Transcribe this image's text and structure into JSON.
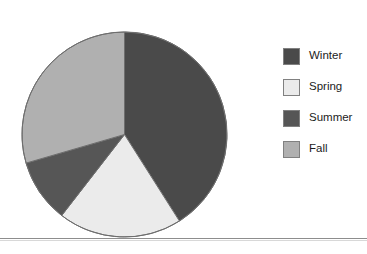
{
  "chart_data": {
    "type": "pie",
    "title": "",
    "categories": [
      "Winter",
      "Spring",
      "Summer",
      "Fall"
    ],
    "values": [
      41,
      19.5,
      10,
      29.5
    ],
    "units": "percent",
    "start_angle_deg": 0,
    "direction": "clockwise",
    "slices": [
      {
        "label": "Winter",
        "value": 41,
        "color": "#4a4a4a",
        "start_deg": 0,
        "end_deg": 147.6
      },
      {
        "label": "Spring",
        "value": 19.5,
        "color": "#ebebeb",
        "start_deg": 147.6,
        "end_deg": 217.8
      },
      {
        "label": "Summer",
        "value": 10,
        "color": "#565656",
        "start_deg": 217.8,
        "end_deg": 253.8
      },
      {
        "label": "Fall",
        "value": 29.5,
        "color": "#b0b0b0",
        "start_deg": 253.8,
        "end_deg": 360
      }
    ],
    "legend": {
      "position": "right",
      "entries": [
        {
          "label": "Winter",
          "color": "#4a4a4a"
        },
        {
          "label": "Spring",
          "color": "#ebebeb"
        },
        {
          "label": "Summer",
          "color": "#565656"
        },
        {
          "label": "Fall",
          "color": "#b0b0b0"
        }
      ]
    },
    "grid": false,
    "xlabel": "",
    "ylabel": ""
  },
  "geometry": {
    "center_x": 103.5,
    "center_y": 103.5,
    "radius": 102.5
  },
  "style": {
    "slice_outline": "#6e6e6e",
    "legend_swatch_border": "#808080",
    "rule_color": "#8d8d8d",
    "background": "#ffffff"
  }
}
